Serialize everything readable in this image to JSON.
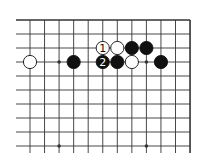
{
  "diagram": {
    "type": "go-board-fragment",
    "corner": "top-right",
    "columns": 12,
    "rows": 10,
    "grid": {
      "x0": 30,
      "dx": 14.55,
      "y0": 20,
      "dy": 14,
      "left_extend_to": 16,
      "bottom_extend_to": 153
    },
    "colors": {
      "line": "#333333",
      "black_stone": "#111111",
      "white_stone": "#ffffff",
      "background": "#ffffff"
    },
    "star_points": [
      {
        "col": 2,
        "row": 3
      },
      {
        "col": 8,
        "row": 3
      },
      {
        "col": 2,
        "row": 9
      },
      {
        "col": 8,
        "row": 9
      }
    ],
    "stones": [
      {
        "color": "white",
        "col": 0,
        "row": 3,
        "label": ""
      },
      {
        "color": "black",
        "col": 3,
        "row": 3,
        "label": ""
      },
      {
        "color": "white",
        "col": 5,
        "row": 2,
        "label": "1"
      },
      {
        "color": "white",
        "col": 6,
        "row": 2,
        "label": ""
      },
      {
        "color": "black",
        "col": 7,
        "row": 2,
        "label": ""
      },
      {
        "color": "black",
        "col": 8,
        "row": 2,
        "label": ""
      },
      {
        "color": "black",
        "col": 5,
        "row": 3,
        "label": "2"
      },
      {
        "color": "black",
        "col": 6,
        "row": 3,
        "label": ""
      },
      {
        "color": "white",
        "col": 7,
        "row": 3,
        "label": ""
      },
      {
        "color": "black",
        "col": 9,
        "row": 3,
        "label": ""
      }
    ]
  }
}
